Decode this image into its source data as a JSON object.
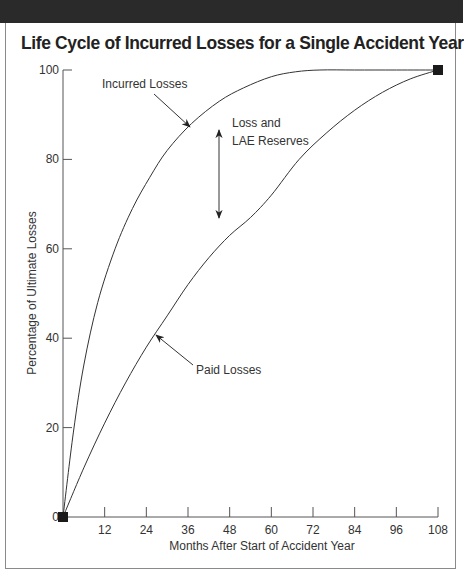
{
  "header": {
    "band_color": "#2a2a2a"
  },
  "title": "Life Cycle of Incurred Losses for a Single Accident Year",
  "chart_data": {
    "type": "line",
    "title": "Life Cycle of Incurred Losses for a Single Accident Year",
    "xlabel": "Months After Start of Accident Year",
    "ylabel": "Percentage of Ultimate Losses",
    "xlim": [
      0,
      108
    ],
    "ylim": [
      0,
      100
    ],
    "xticks": [
      12,
      24,
      36,
      48,
      60,
      72,
      84,
      96,
      108
    ],
    "yticks": [
      0,
      20,
      40,
      60,
      80,
      100
    ],
    "grid": false,
    "series": [
      {
        "name": "Incurred Losses",
        "x": [
          0,
          3,
          6,
          10,
          15,
          20,
          25,
          30,
          37,
          45,
          52,
          60,
          67,
          74,
          84,
          96,
          108
        ],
        "values": [
          0,
          19,
          34,
          48,
          60,
          69,
          76,
          82,
          88,
          93,
          96,
          98.5,
          99.6,
          100,
          100,
          100,
          100
        ]
      },
      {
        "name": "Paid Losses",
        "x": [
          0,
          6,
          12,
          18,
          24,
          30,
          36,
          42,
          48,
          54,
          60,
          68,
          76,
          84,
          92,
          100,
          108
        ],
        "values": [
          0,
          11,
          21,
          30,
          38,
          45,
          52,
          58,
          63,
          67,
          72,
          80,
          86,
          91,
          95,
          98,
          100
        ]
      }
    ],
    "markers": [
      {
        "x": 0,
        "y": 0,
        "shape": "square"
      },
      {
        "x": 108,
        "y": 100,
        "shape": "square"
      }
    ],
    "annotations": [
      {
        "text": "Incurred Losses",
        "points_to": "Incurred Losses"
      },
      {
        "text": "Loss and",
        "text2": "LAE Reserves",
        "type": "double-arrow-between-curves"
      },
      {
        "text": "Paid Losses",
        "points_to": "Paid Losses"
      }
    ]
  },
  "labels": {
    "incurred": "Incurred Losses",
    "reserves_line1": "Loss and",
    "reserves_line2": "LAE Reserves",
    "paid": "Paid Losses"
  }
}
